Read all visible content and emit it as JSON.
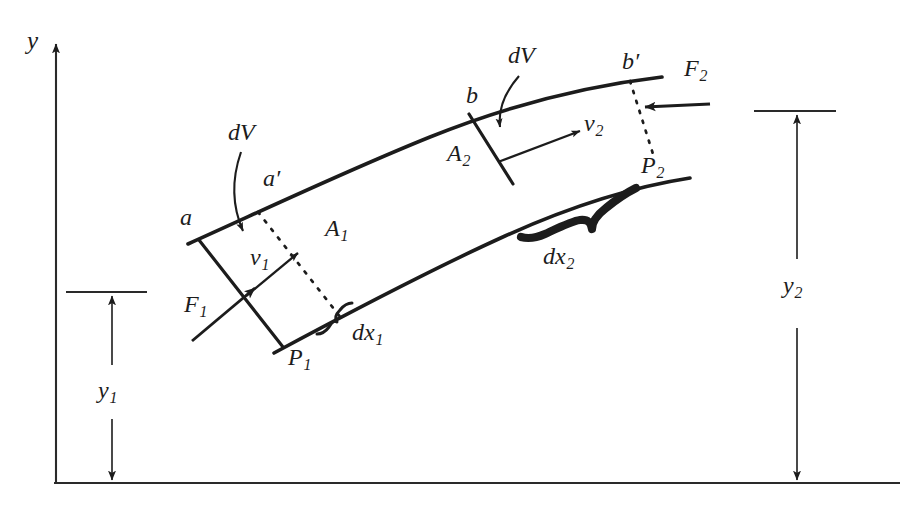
{
  "figure": {
    "ink_color": "#1c1c1c",
    "background_color": "#ffffff"
  },
  "axes": {
    "y_axis_label": "y",
    "y_axis": {
      "x": 56,
      "top_y": 38,
      "bottom_y": 483
    },
    "baseline": {
      "y": 483,
      "x_start": 54,
      "x_end": 900
    }
  },
  "heights": {
    "y1": {
      "label": "y",
      "subscript": "1",
      "reference_line_y": 292,
      "ref_x_start": 66,
      "ref_x_end": 147,
      "arrow_x": 112
    },
    "y2": {
      "label": "y",
      "subscript": "2",
      "reference_line_y": 111,
      "ref_x_start": 754,
      "ref_x_end": 836,
      "arrow_x": 797
    }
  },
  "labels": {
    "dV_left": "dV",
    "dV_right": "dV",
    "point_a": "a",
    "point_a_prime": "a′",
    "point_b": "b",
    "point_b_prime": "b′",
    "area_1": {
      "base": "A",
      "sub": "1"
    },
    "area_2": {
      "base": "A",
      "sub": "2"
    },
    "velocity_1": {
      "base": "v",
      "sub": "1"
    },
    "velocity_2": {
      "base": "v",
      "sub": "2"
    },
    "force_1": {
      "base": "F",
      "sub": "1"
    },
    "force_2": {
      "base": "F",
      "sub": "2"
    },
    "pressure_point_1": {
      "base": "P",
      "sub": "1"
    },
    "pressure_point_2": {
      "base": "P",
      "sub": "2"
    },
    "dx_1": {
      "base": "dx",
      "sub": "1"
    },
    "dx_2": {
      "base": "dx",
      "sub": "2"
    }
  },
  "geometry": {
    "upper_wall": "M 188,244 C 268,208 348,170 430,137 C 512,104 585,86 662,77",
    "lower_wall": "M 274,353 C 352,311 430,270 505,236 C 576,204 638,186 690,178",
    "section_a_line": {
      "x1": 196,
      "y1": 238,
      "x2": 281,
      "y2": 345
    },
    "section_a_prime_line": {
      "x1": 257,
      "y1": 211,
      "x2": 340,
      "y2": 316
    },
    "section_b_line": {
      "x1": 470,
      "y1": 116,
      "x2": 513,
      "y2": 182
    },
    "section_b_prime_line": {
      "x1": 629,
      "y1": 80,
      "x2": 654,
      "y2": 152
    }
  }
}
